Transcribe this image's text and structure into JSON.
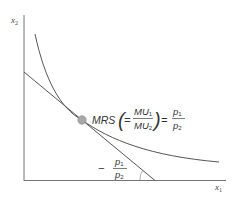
{
  "diagram": {
    "type": "consumer-optimum",
    "axes": {
      "y_label": "x",
      "y_label_sub": "2",
      "x_label": "x",
      "x_label_sub": "1"
    },
    "elements": {
      "indifference_curve": "convex indifference curve",
      "budget_line": "budget line tangent to indifference curve",
      "tangent_point": "optimal consumption bundle"
    },
    "equation": {
      "lhs": "MRS",
      "open_paren": "(",
      "eq1": "=",
      "frac1_num": "MU",
      "frac1_num_sub": "1",
      "frac1_den": "MU",
      "frac1_den_sub": "2",
      "close_paren": ")",
      "eq2": "=",
      "frac2_num": "p",
      "frac2_num_sub": "1",
      "frac2_den": "p",
      "frac2_den_sub": "2"
    },
    "slope_label": {
      "minus": "−",
      "num": "p",
      "num_sub": "1",
      "den": "p",
      "den_sub": "2"
    },
    "colors": {
      "axis": "#555555",
      "curve": "#555555",
      "point_fill": "#a8a8a8",
      "point_stroke": "#777777",
      "text": "#333333"
    }
  }
}
